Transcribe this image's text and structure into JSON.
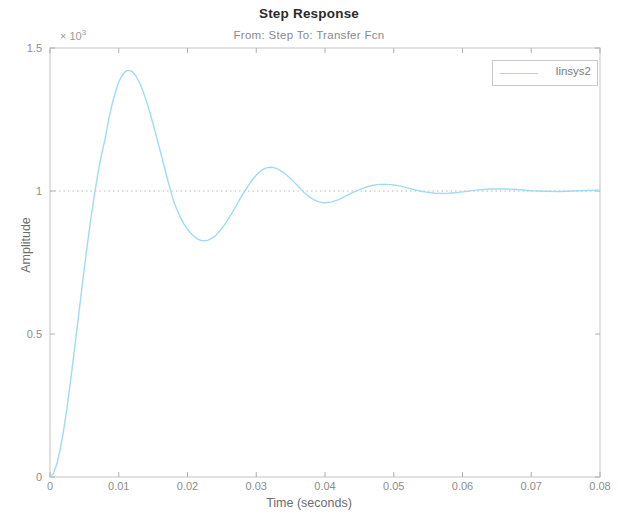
{
  "chart_data": {
    "type": "line",
    "title": "Step Response",
    "subtitle": "From: Step  To: Transfer Fcn",
    "xlabel": "Time (seconds)",
    "ylabel": "Amplitude",
    "y_exponent_label": "× 10",
    "y_exponent_power": "3",
    "xlim": [
      0,
      0.08
    ],
    "ylim": [
      0,
      1.5
    ],
    "grid": false,
    "legend_position": "top-right",
    "xticks": [
      0,
      0.01,
      0.02,
      0.03,
      0.04,
      0.05,
      0.06,
      0.07,
      0.08
    ],
    "xtick_labels": [
      "0",
      "0.01",
      "0.02",
      "0.03",
      "0.04",
      "0.05",
      "0.06",
      "0.07",
      "0.08"
    ],
    "yticks": [
      0,
      0.5,
      1,
      1.5
    ],
    "ytick_labels": [
      "0",
      "0.5",
      "1",
      "1.5"
    ],
    "reference_line": {
      "y": 1.0,
      "style": "dotted",
      "color": "#b9b9b9"
    },
    "series": [
      {
        "name": "linsys2",
        "color": "#9fdcf0",
        "x": [
          0,
          0.0005,
          0.001,
          0.0015,
          0.002,
          0.0025,
          0.003,
          0.0035,
          0.004,
          0.0045,
          0.005,
          0.0055,
          0.006,
          0.0065,
          0.007,
          0.0075,
          0.008,
          0.0085,
          0.009,
          0.0095,
          0.01,
          0.0105,
          0.011,
          0.0115,
          0.012,
          0.0125,
          0.013,
          0.0135,
          0.014,
          0.0145,
          0.015,
          0.0155,
          0.016,
          0.0165,
          0.017,
          0.0175,
          0.018,
          0.0185,
          0.019,
          0.0195,
          0.02,
          0.0205,
          0.021,
          0.0215,
          0.022,
          0.0225,
          0.023,
          0.0235,
          0.024,
          0.0245,
          0.025,
          0.0255,
          0.026,
          0.0265,
          0.027,
          0.0275,
          0.028,
          0.0285,
          0.029,
          0.0295,
          0.03,
          0.0305,
          0.031,
          0.0315,
          0.032,
          0.0325,
          0.033,
          0.0335,
          0.034,
          0.0345,
          0.035,
          0.0355,
          0.036,
          0.0365,
          0.037,
          0.0375,
          0.038,
          0.0385,
          0.039,
          0.0395,
          0.04,
          0.041,
          0.042,
          0.043,
          0.044,
          0.045,
          0.046,
          0.047,
          0.048,
          0.049,
          0.05,
          0.051,
          0.052,
          0.053,
          0.054,
          0.055,
          0.056,
          0.057,
          0.058,
          0.059,
          0.06,
          0.062,
          0.064,
          0.066,
          0.068,
          0.07,
          0.072,
          0.074,
          0.076,
          0.078,
          0.08
        ],
        "y": [
          0.0,
          0.012,
          0.046,
          0.098,
          0.166,
          0.247,
          0.337,
          0.434,
          0.533,
          0.633,
          0.731,
          0.825,
          0.913,
          0.993,
          1.065,
          1.128,
          1.181,
          1.245,
          1.3,
          1.345,
          1.381,
          1.405,
          1.419,
          1.422,
          1.417,
          1.402,
          1.38,
          1.351,
          1.316,
          1.277,
          1.234,
          1.189,
          1.143,
          1.096,
          1.05,
          1.005,
          0.963,
          0.933,
          0.906,
          0.884,
          0.866,
          0.852,
          0.84,
          0.832,
          0.827,
          0.826,
          0.828,
          0.834,
          0.843,
          0.855,
          0.869,
          0.886,
          0.904,
          0.924,
          0.945,
          0.966,
          0.987,
          1.006,
          1.024,
          1.041,
          1.055,
          1.067,
          1.076,
          1.081,
          1.083,
          1.082,
          1.078,
          1.072,
          1.064,
          1.054,
          1.043,
          1.031,
          1.019,
          1.006,
          0.994,
          0.984,
          0.975,
          0.968,
          0.963,
          0.96,
          0.959,
          0.962,
          0.97,
          0.982,
          0.994,
          1.005,
          1.014,
          1.02,
          1.023,
          1.023,
          1.021,
          1.017,
          1.011,
          1.005,
          0.999,
          0.995,
          0.992,
          0.991,
          0.992,
          0.994,
          0.997,
          1.003,
          1.007,
          1.007,
          1.005,
          1.001,
          0.999,
          0.998,
          1.0,
          1.002,
          1.003
        ]
      }
    ]
  },
  "legend": {
    "entries": [
      {
        "label": "linsys2"
      }
    ]
  }
}
